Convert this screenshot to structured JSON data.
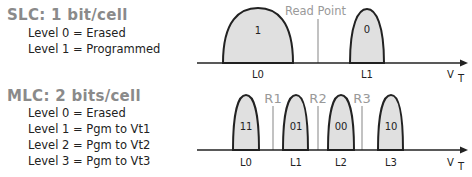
{
  "slc": {
    "title": "SLC:  1 bit/cell",
    "lines": [
      "Level 0 = Erased",
      "Level 1 = Programmed"
    ],
    "read_point_label": "Read Point",
    "states": [
      {
        "level": "L0",
        "bits": "1"
      },
      {
        "level": "L1",
        "bits": "0"
      }
    ],
    "axis_label": "V",
    "axis_sub": "T"
  },
  "mlc": {
    "title": "MLC: 2 bits/cell",
    "lines": [
      "Level 0 = Erased",
      "Level 1 = Pgm to Vt1",
      "Level 2 = Pgm to Vt2",
      "Level 3 = Pgm to Vt3"
    ],
    "read_levels": [
      "R1",
      "R2",
      "R3"
    ],
    "states": [
      {
        "level": "L0",
        "bits": "11"
      },
      {
        "level": "L1",
        "bits": "01"
      },
      {
        "level": "L2",
        "bits": "00"
      },
      {
        "level": "L3",
        "bits": "10"
      }
    ],
    "axis_label": "V",
    "axis_sub": "T"
  },
  "colors": {
    "fill": "#e0e0e0",
    "stroke": "#222222",
    "title": "#8a8a8a",
    "read_line": "#999999"
  }
}
